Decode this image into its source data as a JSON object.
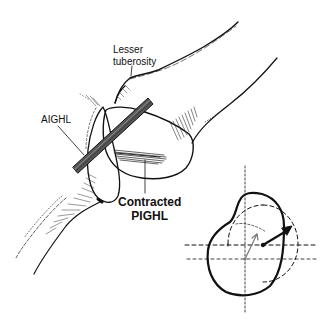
{
  "figure": {
    "type": "anatomical-diagram",
    "labels": {
      "lesser_tuberosity_line1": "Lesser",
      "lesser_tuberosity_line2": "tuberosity",
      "aighl": "AIGHL",
      "contracted_pighl_line1": "Contracted",
      "contracted_pighl_line2": "PIGHL"
    },
    "inset": {
      "description": "humeral head translation schematic",
      "elements": [
        "solid kidney-shaped outline",
        "dashed circle (shifted)",
        "dashed crosshair axes",
        "thin gray arrow",
        "bold black arrow"
      ]
    },
    "colors": {
      "ink": "#111111",
      "background": "#ffffff",
      "hatch": "#333333",
      "ligament_fill": "#555555"
    }
  }
}
